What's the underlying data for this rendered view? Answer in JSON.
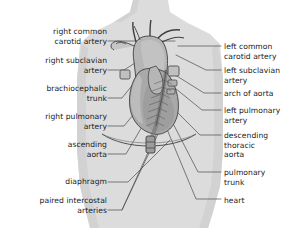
{
  "figure": {
    "type": "anatomical-diagram",
    "colors": {
      "page_background": "#ffffff",
      "body_silhouette": "#dcdcdc",
      "body_silhouette_shade": "#d2d2d2",
      "vessel_fill": "#b6b6b6",
      "vessel_fill_light": "#c6c6c6",
      "heart_fill": "#a9a9a9",
      "outline": "#3f3f3f",
      "leader_line": "#4a4a4a",
      "text": "#1b1b1b"
    }
  },
  "labels_left": [
    {
      "id": "right-common-carotid-artery",
      "lines": [
        "right common",
        "carotid artery"
      ],
      "x": 21,
      "y": 27,
      "width": 86
    },
    {
      "id": "right-subclavian-artery",
      "lines": [
        "right subclavian",
        "artery"
      ],
      "x": 21,
      "y": 56,
      "width": 86
    },
    {
      "id": "brachiocephalic-trunk",
      "lines": [
        "brachiocephalic",
        "trunk"
      ],
      "x": 21,
      "y": 84,
      "width": 86
    },
    {
      "id": "right-pulmonary-artery",
      "lines": [
        "right pulmonary",
        "artery"
      ],
      "x": 21,
      "y": 112,
      "width": 86
    },
    {
      "id": "ascending-aorta",
      "lines": [
        "ascending",
        "aorta"
      ],
      "x": 21,
      "y": 140,
      "width": 86
    },
    {
      "id": "diaphragm",
      "lines": [
        "diaphragm"
      ],
      "x": 21,
      "y": 168,
      "width": 86
    },
    {
      "id": "paired-intercostal-arteries",
      "lines": [
        "paired intercostal",
        "arteries"
      ],
      "x": 11,
      "y": 196,
      "width": 96
    }
  ],
  "labels_right": [
    {
      "id": "left-common-carotid-artery",
      "lines": [
        "left common",
        "carotid artery"
      ],
      "x": 224,
      "y": 42
    },
    {
      "id": "left-subclavian-artery",
      "lines": [
        "left subclavian",
        "artery"
      ],
      "x": 224,
      "y": 66
    },
    {
      "id": "arch-of-aorta",
      "lines": [
        "arch of aorta"
      ],
      "x": 224,
      "y": 91
    },
    {
      "id": "left-pulmonary-artery",
      "lines": [
        "left pulmonary",
        "artery"
      ],
      "x": 224,
      "y": 106
    },
    {
      "id": "descending-thoracic-aorta",
      "lines": [
        "descending",
        "thoracic",
        "aorta"
      ],
      "x": 224,
      "y": 131
    },
    {
      "id": "pulmonary-trunk",
      "lines": [
        "pulmonary",
        "trunk"
      ],
      "x": 224,
      "y": 168
    },
    {
      "id": "heart",
      "lines": [
        "heart"
      ],
      "x": 224,
      "y": 196
    }
  ]
}
